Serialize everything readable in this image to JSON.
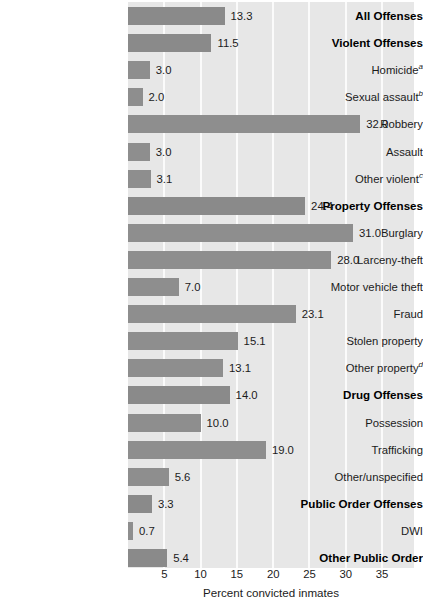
{
  "chart_data": {
    "type": "bar",
    "orientation": "horizontal",
    "title": "",
    "xlabel": "Percent convicted inmates",
    "ylabel": "",
    "xlim": [
      0,
      39.4
    ],
    "xticks": [
      5,
      10,
      15,
      20,
      25,
      30,
      35
    ],
    "xtick_labels": [
      "5",
      "10",
      "15",
      "20",
      "25",
      "30",
      "35"
    ],
    "grid": "vertical-white",
    "legend": "none",
    "bar_color": "#8e8e8e",
    "plot_background": "#e7e7e7",
    "categories": [
      "All Offenses",
      "Violent Offenses",
      "Homicide",
      "Sexual assault",
      "Robbery",
      "Assault",
      "Other violent",
      "Property Offenses",
      "Burglary",
      "Larceny-theft",
      "Motor vehicle theft",
      "Fraud",
      "Stolen property",
      "Other property",
      "Drug Offenses",
      "Possession",
      "Trafficking",
      "Other/unspecified",
      "Public Order Offenses",
      "DWI",
      "Other Public Order"
    ],
    "values": [
      13.3,
      11.5,
      3.0,
      2.0,
      32.0,
      3.0,
      3.1,
      24.4,
      31.0,
      28.0,
      7.0,
      23.1,
      15.1,
      13.1,
      14.0,
      10.0,
      19.0,
      5.6,
      3.3,
      0.7,
      5.4
    ],
    "footnote_markers": [
      "",
      "",
      "a",
      "b",
      "",
      "",
      "c",
      "",
      "",
      "",
      "",
      "",
      "",
      "d",
      "",
      "",
      "",
      "",
      "",
      "",
      ""
    ]
  },
  "rows": [
    {
      "label": "All Offenses",
      "sup": "",
      "value": 13.3,
      "value_text": "13.3",
      "bold": true
    },
    {
      "label": "Violent Offenses",
      "sup": "",
      "value": 11.5,
      "value_text": "11.5",
      "bold": true
    },
    {
      "label": "Homicide",
      "sup": "a",
      "value": 3.0,
      "value_text": "3.0",
      "bold": false
    },
    {
      "label": "Sexual assault",
      "sup": "b",
      "value": 2.0,
      "value_text": "2.0",
      "bold": false
    },
    {
      "label": "Robbery",
      "sup": "",
      "value": 32.0,
      "value_text": "32.0",
      "bold": false
    },
    {
      "label": "Assault",
      "sup": "",
      "value": 3.0,
      "value_text": "3.0",
      "bold": false
    },
    {
      "label": "Other violent",
      "sup": "c",
      "value": 3.1,
      "value_text": "3.1",
      "bold": false
    },
    {
      "label": "Property Offenses",
      "sup": "",
      "value": 24.4,
      "value_text": "24.4",
      "bold": true
    },
    {
      "label": "Burglary",
      "sup": "",
      "value": 31.0,
      "value_text": "31.0",
      "bold": false
    },
    {
      "label": "Larceny-theft",
      "sup": "",
      "value": 28.0,
      "value_text": "28.0",
      "bold": false
    },
    {
      "label": "Motor vehicle theft",
      "sup": "",
      "value": 7.0,
      "value_text": "7.0",
      "bold": false
    },
    {
      "label": "Fraud",
      "sup": "",
      "value": 23.1,
      "value_text": "23.1",
      "bold": false
    },
    {
      "label": "Stolen property",
      "sup": "",
      "value": 15.1,
      "value_text": "15.1",
      "bold": false
    },
    {
      "label": "Other property",
      "sup": "d",
      "value": 13.1,
      "value_text": "13.1",
      "bold": false
    },
    {
      "label": "Drug Offenses",
      "sup": "",
      "value": 14.0,
      "value_text": "14.0",
      "bold": true
    },
    {
      "label": "Possession",
      "sup": "",
      "value": 10.0,
      "value_text": "10.0",
      "bold": false
    },
    {
      "label": "Trafficking",
      "sup": "",
      "value": 19.0,
      "value_text": "19.0",
      "bold": false
    },
    {
      "label": "Other/unspecified",
      "sup": "",
      "value": 5.6,
      "value_text": "5.6",
      "bold": false
    },
    {
      "label": "Public Order Offenses",
      "sup": "",
      "value": 3.3,
      "value_text": "3.3",
      "bold": true
    },
    {
      "label": "DWI",
      "sup": "",
      "value": 0.7,
      "value_text": "0.7",
      "bold": false
    },
    {
      "label": "Other Public Order",
      "sup": "",
      "value": 5.4,
      "value_text": "5.4",
      "bold": true
    }
  ],
  "axis": {
    "title": "Percent convicted inmates",
    "ticks": [
      "5",
      "10",
      "15",
      "20",
      "25",
      "30",
      "35"
    ]
  }
}
